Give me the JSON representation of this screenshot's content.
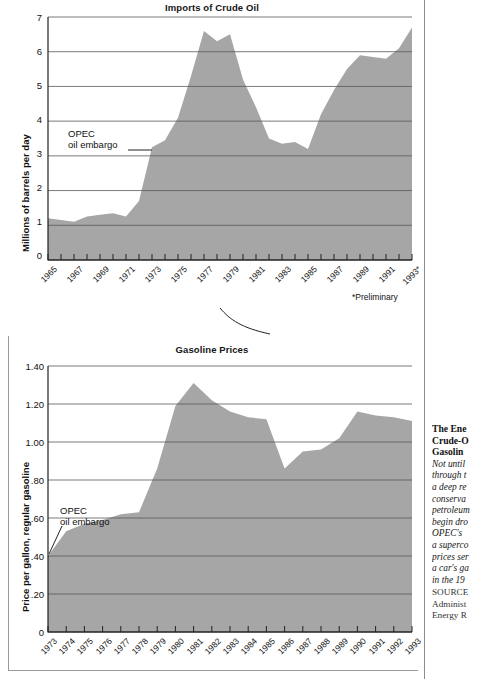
{
  "figure": {
    "gutter_color": "#8d8d8d",
    "area_fill": "#a6a6a6",
    "grid_color": "#595959"
  },
  "charts": [
    {
      "id": "imports-of-crude-oil",
      "title": "Imports of Crude Oil",
      "ylabel": "Millions of barrels per day",
      "annotation_line1": "OPEC",
      "annotation_line2": "oil embargo",
      "footnote": "*Preliminary"
    },
    {
      "id": "gasoline-prices",
      "title": "Gasoline Prices",
      "ylabel": "Price per gallon, regular gasoline",
      "annotation_line1": "OPEC",
      "annotation_line2": "oil embargo",
      "footnote": ""
    }
  ],
  "chart_data": [
    {
      "type": "area",
      "title": "Imports of Crude Oil",
      "xlabel": "",
      "ylabel": "Millions of barrels per day",
      "ylim": [
        0,
        7
      ],
      "yticks": [
        0,
        1,
        2,
        3,
        4,
        5,
        6,
        7
      ],
      "ytick_labels": [
        "0",
        "1",
        "2",
        "3",
        "4",
        "5",
        "6",
        "7"
      ],
      "grid": true,
      "legend": "none",
      "annotations": [
        {
          "text": "OPEC oil embargo",
          "x": "1973",
          "y": 3.3
        },
        {
          "text": "*Preliminary",
          "x": "1993*",
          "y": null
        }
      ],
      "x": [
        "1965",
        "1966",
        "1967",
        "1968",
        "1969",
        "1970",
        "1971",
        "1972",
        "1973",
        "1974",
        "1975",
        "1976",
        "1977",
        "1978",
        "1979",
        "1980",
        "1981",
        "1982",
        "1983",
        "1984",
        "1985",
        "1986",
        "1987",
        "1988",
        "1989",
        "1990",
        "1991",
        "1992",
        "1993*"
      ],
      "xtick_labels": [
        "1965",
        "",
        "1967",
        "",
        "1969",
        "",
        "1971",
        "",
        "1973",
        "",
        "1975",
        "",
        "1977",
        "",
        "1979",
        "",
        "1981",
        "",
        "1983",
        "",
        "1985",
        "",
        "1987",
        "",
        "1989",
        "",
        "1991",
        "",
        "1993*"
      ],
      "values": [
        1.2,
        1.15,
        1.1,
        1.25,
        1.3,
        1.35,
        1.25,
        1.7,
        3.25,
        3.45,
        4.1,
        5.3,
        6.6,
        6.3,
        6.5,
        5.2,
        4.4,
        3.5,
        3.35,
        3.4,
        3.2,
        4.2,
        4.9,
        5.5,
        5.9,
        5.85,
        5.8,
        6.1,
        6.7
      ]
    },
    {
      "type": "area",
      "title": "Gasoline Prices",
      "xlabel": "",
      "ylabel": "Price per gallon, regular gasoline",
      "ylim": [
        0,
        1.4
      ],
      "yticks": [
        0,
        0.2,
        0.4,
        0.6,
        0.8,
        1.0,
        1.2,
        1.4
      ],
      "ytick_labels": [
        "0",
        ".20",
        ".40",
        ".60",
        ".80",
        "1.00",
        "1.20",
        "1.40"
      ],
      "grid": true,
      "legend": "none",
      "annotations": [
        {
          "text": "OPEC oil embargo",
          "x": "1973",
          "y": 0.4
        }
      ],
      "x": [
        "1973",
        "1974",
        "1975",
        "1976",
        "1977",
        "1978",
        "1979",
        "1980",
        "1981",
        "1982",
        "1983",
        "1984",
        "1985",
        "1986",
        "1987",
        "1988",
        "1989",
        "1990",
        "1991",
        "1992",
        "1993"
      ],
      "xtick_labels": [
        "1973",
        "1974",
        "1975",
        "1976",
        "1977",
        "1978",
        "1979",
        "1980",
        "1981",
        "1982",
        "1983",
        "1984",
        "1985",
        "1986",
        "1987",
        "1988",
        "1989",
        "1990",
        "1991",
        "1992",
        "1993"
      ],
      "values": [
        0.4,
        0.53,
        0.57,
        0.59,
        0.62,
        0.63,
        0.86,
        1.19,
        1.31,
        1.22,
        1.16,
        1.13,
        1.12,
        0.86,
        0.95,
        0.96,
        1.02,
        1.16,
        1.14,
        1.13,
        1.11
      ]
    }
  ],
  "side_caption": {
    "heading": [
      "The Ene",
      "Crude-O",
      "Gasolin"
    ],
    "body": [
      "Not until",
      "through t",
      "a deep re",
      "conserva",
      "petroleum",
      "begin dro",
      "OPEC's",
      "a superco",
      "prices ser",
      "a car's ga",
      "in the 19"
    ],
    "source": [
      "SOURCE",
      "Administ",
      "Energy R"
    ]
  }
}
